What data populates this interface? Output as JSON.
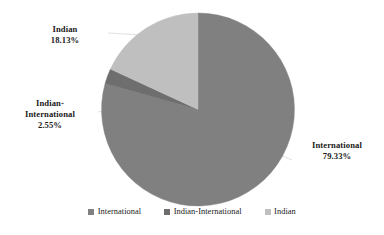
{
  "chart_data": {
    "type": "pie",
    "title": "",
    "categories": [
      "International",
      "Indian-International",
      "Indian"
    ],
    "values": [
      79.33,
      2.55,
      18.13
    ],
    "value_labels": [
      "79.33%",
      "2.55%",
      "18.13%"
    ],
    "unit": "%",
    "colors": [
      "#808080",
      "#6E6E6E",
      "#BFBFBF"
    ],
    "start_angle_deg": 0,
    "direction": "clockwise",
    "legend_position": "bottom",
    "grid": false,
    "slices": [
      {
        "name": "International",
        "value": 79.33,
        "label": "79.33%",
        "color": "#808080"
      },
      {
        "name": "Indian-International",
        "value": 2.55,
        "label": "2.55%",
        "color": "#6E6E6E"
      },
      {
        "name": "Indian",
        "value": 18.13,
        "label": "18.13%",
        "color": "#BFBFBF"
      }
    ]
  },
  "callouts": {
    "indian": {
      "name": "Indian",
      "value": "18.13%"
    },
    "indian_international_line1": "Indian-",
    "indian_international_line2": "International",
    "indian_international_value": "2.55%",
    "international": {
      "name": "International",
      "value": "79.33%"
    }
  },
  "legend": {
    "items": [
      {
        "label": "International",
        "color": "#808080"
      },
      {
        "label": "Indian-International",
        "color": "#6E6E6E"
      },
      {
        "label": "Indian",
        "color": "#BFBFBF"
      }
    ]
  }
}
